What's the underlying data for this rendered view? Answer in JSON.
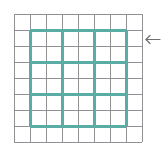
{
  "figure": {
    "width": 161,
    "height": 159,
    "background_color": "#ffffff"
  },
  "minor_grid": {
    "name": "minor-grid",
    "color": "#8f9194",
    "line_width": 1,
    "cell_size": 16,
    "columns": 8,
    "rows": 8,
    "x_positions": [
      14,
      30,
      46,
      62,
      78,
      94,
      110,
      126,
      142
    ],
    "y_positions": [
      14,
      30,
      46,
      62,
      78,
      94,
      110,
      126,
      142
    ],
    "x_start": 14,
    "x_end": 142,
    "y_start": 14,
    "y_end": 142
  },
  "major_grid": {
    "name": "major-grid",
    "color": "#5aada4",
    "line_width": 3,
    "cell_size": 32,
    "columns": 3,
    "rows": 3,
    "x_positions": [
      30,
      62,
      94,
      126
    ],
    "y_positions": [
      30,
      62,
      94,
      126
    ],
    "x_start": 30,
    "x_end": 126,
    "y_start": 30,
    "y_end": 126
  },
  "annotation": {
    "name": "left-arrow",
    "direction": "left",
    "color": "#6d6f72",
    "tip_x": 146,
    "tail_x": 160,
    "y": 39,
    "head_size": 4,
    "label": ""
  }
}
